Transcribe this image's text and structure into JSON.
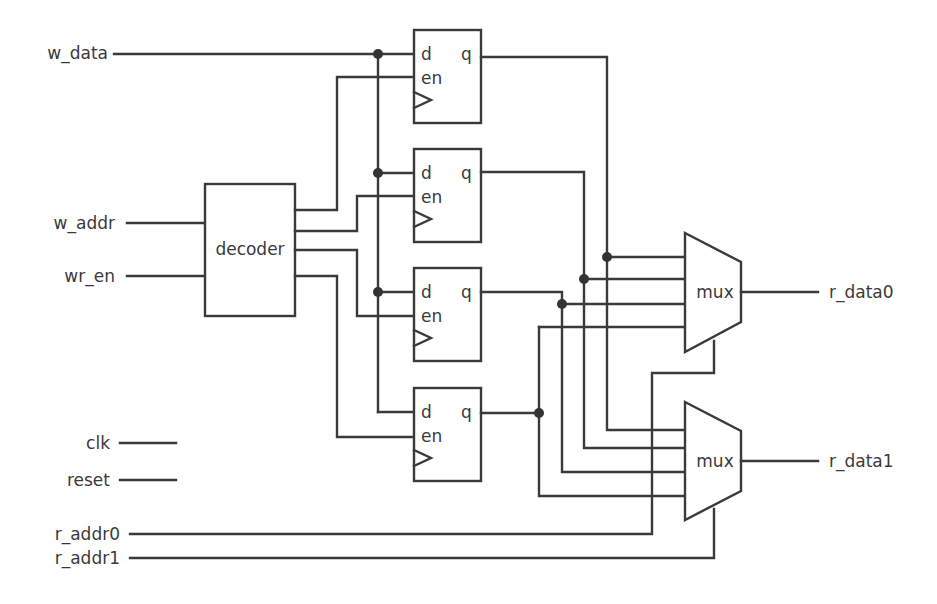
{
  "diagram": {
    "inputs": {
      "w_data": "w_data",
      "w_addr": "w_addr",
      "wr_en": "wr_en",
      "clk": "clk",
      "reset": "reset",
      "r_addr0": "r_addr0",
      "r_addr1": "r_addr1"
    },
    "outputs": {
      "r_data0": "r_data0",
      "r_data1": "r_data1"
    },
    "decoder": {
      "label": "decoder"
    },
    "registers": [
      {
        "d": "d",
        "q": "q",
        "en": "en"
      },
      {
        "d": "d",
        "q": "q",
        "en": "en"
      },
      {
        "d": "d",
        "q": "q",
        "en": "en"
      },
      {
        "d": "d",
        "q": "q",
        "en": "en"
      }
    ],
    "muxes": [
      {
        "label": "mux"
      },
      {
        "label": "mux"
      }
    ],
    "colors": {
      "line": "#3a3a3a",
      "background": "#ffffff"
    }
  }
}
